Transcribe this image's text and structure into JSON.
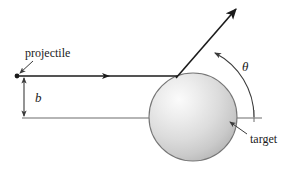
{
  "figure": {
    "width": 292,
    "height": 170,
    "background_color": "#ffffff",
    "stroke_color": "#3b3b3b",
    "dark_stroke_color": "#1b1b1b",
    "sphere_fill_light": "#f2f2f2",
    "sphere_fill_mid": "#d2d2d2",
    "sphere_fill_dark": "#b4b4b4",
    "sphere_outline_color": "#6f6f6f"
  },
  "labels": {
    "projectile": "projectile",
    "impact_parameter": "b",
    "scattering_angle": "θ",
    "target": "target"
  },
  "geometry": {
    "projectile_start_x": 17,
    "projectile_start_y": 76,
    "incoming_ray_end_x": 178,
    "incoming_ray_y": 76,
    "axis_line_y": 118,
    "axis_line_start_x": 22,
    "axis_line_end_x": 262,
    "impact_parameter_value_px": 42,
    "sphere_center_x": 193,
    "sphere_center_y": 117,
    "sphere_radius": 44,
    "scatter_point_x": 176,
    "scatter_point_y": 77,
    "outgoing_ray_end_x": 236,
    "outgoing_ray_end_y": 8,
    "angle_arc_radius": 70,
    "angle_degrees": 62
  }
}
